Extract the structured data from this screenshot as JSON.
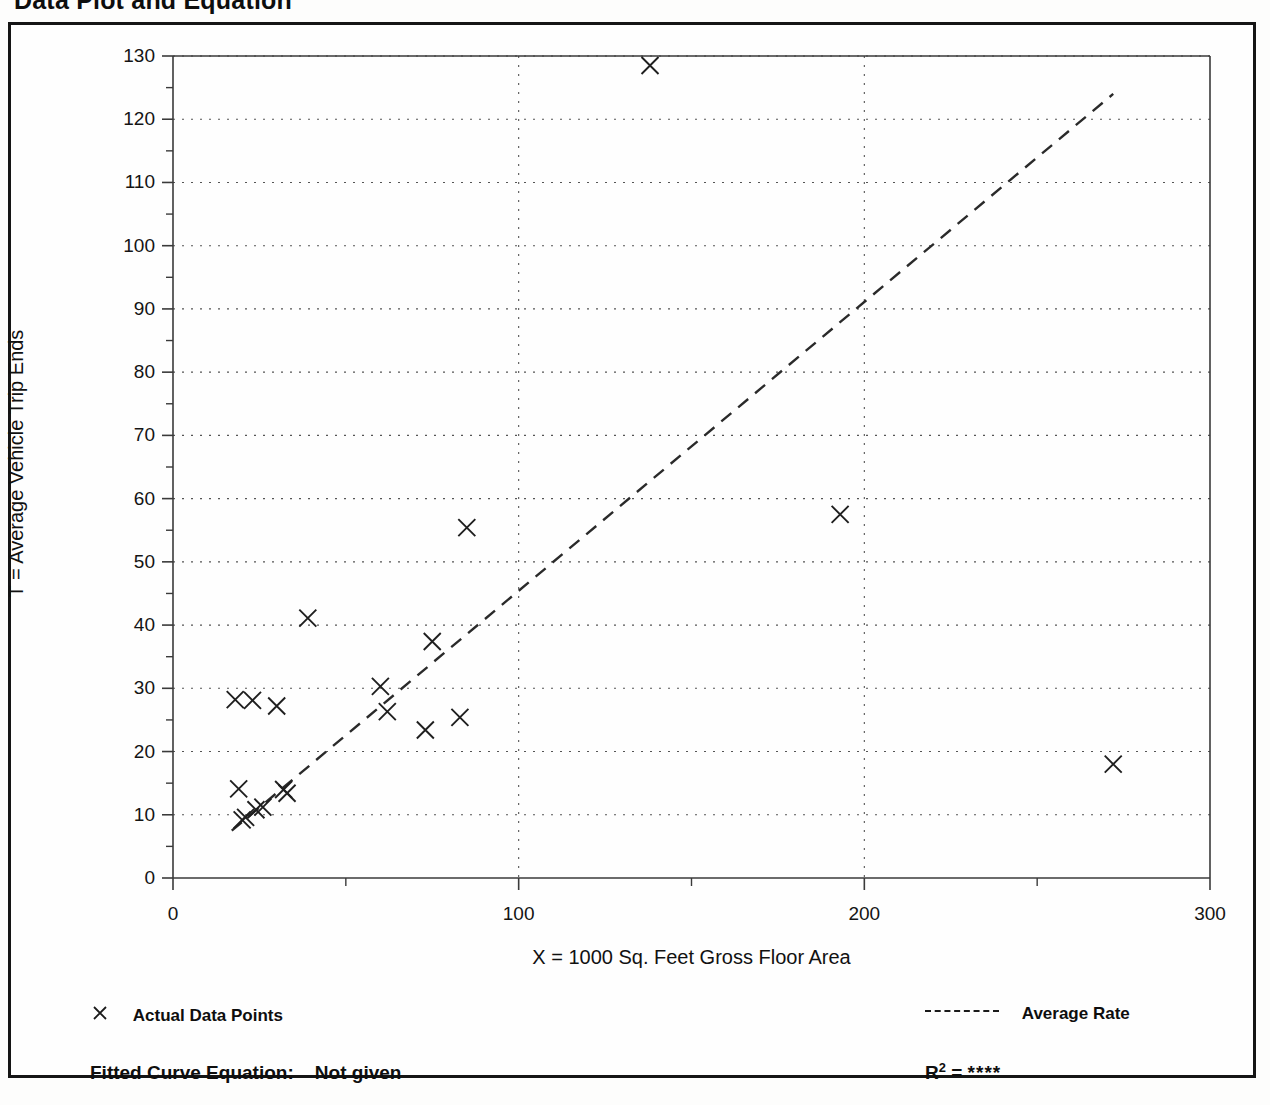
{
  "page": {
    "title": "Data Plot and Equation"
  },
  "footer": {
    "legend_points_label": "Actual Data Points",
    "legend_points_marker": "x-marker-icon",
    "legend_rate_label": "Average Rate",
    "legend_rate_marker": "dashed-line-icon",
    "equation_label": "Fitted Curve Equation:",
    "equation_value": "Not given",
    "r2_label": "R",
    "r2_exponent": "2",
    "r2_equals": "=",
    "r2_value": "****"
  },
  "chart_data": {
    "type": "scatter",
    "title": "Data Plot and Equation",
    "xlabel": "X = 1000 Sq. Feet Gross Floor Area",
    "ylabel": "T = Average Vehicle Trip Ends",
    "xlim": [
      0,
      300
    ],
    "ylim": [
      0,
      130
    ],
    "xticks": [
      0,
      100,
      200,
      300
    ],
    "yticks": [
      0,
      10,
      20,
      30,
      40,
      50,
      60,
      70,
      80,
      90,
      100,
      110,
      120,
      130
    ],
    "xtick_labels": [
      "0",
      "100",
      "200",
      "300"
    ],
    "ytick_labels": [
      "0",
      "10",
      "20",
      "30",
      "40",
      "50",
      "60",
      "70",
      "80",
      "90",
      "100",
      "110",
      "120",
      "130"
    ],
    "grid": "dotted-both-axes",
    "legend_position": "below-plot",
    "marker": "x",
    "series": [
      {
        "name": "Actual Data Points",
        "type": "scatter",
        "points": [
          {
            "x": 18,
            "y": 28.2
          },
          {
            "x": 19,
            "y": 14.1
          },
          {
            "x": 20,
            "y": 9.2
          },
          {
            "x": 21,
            "y": 9.6
          },
          {
            "x": 23,
            "y": 28.1
          },
          {
            "x": 24,
            "y": 10.8
          },
          {
            "x": 26,
            "y": 11.2
          },
          {
            "x": 30,
            "y": 27.2
          },
          {
            "x": 32,
            "y": 14.0
          },
          {
            "x": 33,
            "y": 13.4
          },
          {
            "x": 39,
            "y": 41.1
          },
          {
            "x": 60,
            "y": 30.3
          },
          {
            "x": 62,
            "y": 26.3
          },
          {
            "x": 73,
            "y": 23.4
          },
          {
            "x": 75,
            "y": 37.4
          },
          {
            "x": 83,
            "y": 25.4
          },
          {
            "x": 85,
            "y": 55.4
          },
          {
            "x": 138,
            "y": 128.5
          },
          {
            "x": 193,
            "y": 57.5
          },
          {
            "x": 272,
            "y": 18.0
          }
        ]
      },
      {
        "name": "Average Rate",
        "type": "line",
        "style": "dashed",
        "endpoints": [
          {
            "x": 17,
            "y": 7.5
          },
          {
            "x": 272,
            "y": 124.0
          }
        ]
      }
    ]
  }
}
